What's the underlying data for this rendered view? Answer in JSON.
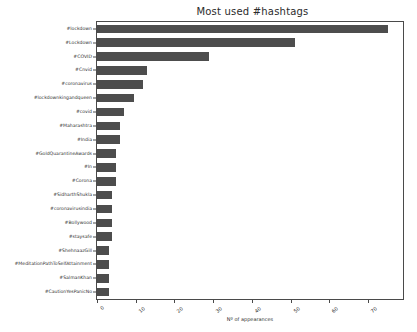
{
  "chart_data": {
    "type": "bar",
    "orientation": "horizontal",
    "title": "Most used #hashtags",
    "xlabel": "Nº of appearances",
    "ylabel": "",
    "xlim": [
      0,
      79
    ],
    "ylim": [
      0,
      20
    ],
    "grid": false,
    "legend": null,
    "bar_color": "#4d4d4d",
    "xticks": [
      0,
      10,
      20,
      30,
      40,
      50,
      60,
      70
    ],
    "xticklabels": [
      "0",
      "10",
      "20",
      "30",
      "40",
      "50",
      "60",
      "70"
    ],
    "categories": [
      "#lockdown",
      "#Lockdown",
      "#COVID",
      "#Cnvid",
      "#coronavirus",
      "#lockdownkingandqueen",
      "#covid",
      "#Maharashtra",
      "#India",
      "#GoldQuarantineAwards",
      "#In",
      "#Corona",
      "#SidharthShukla",
      "#coronavirusindia",
      "#Bollywood",
      "#staysafe",
      "#ShehnaazGill",
      "#MeditationPathToSelfAttainment",
      "#SalmanKhan",
      "#CautionYesPanicNo"
    ],
    "values": [
      75,
      51,
      29,
      13,
      12,
      9.5,
      7,
      6,
      6,
      5,
      5,
      5,
      4,
      4,
      4,
      4,
      3,
      3,
      3,
      3
    ]
  }
}
